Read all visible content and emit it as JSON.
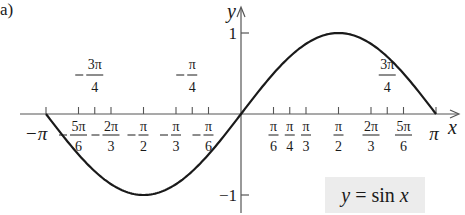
{
  "panel_label": "a)",
  "legend": {
    "y": "y",
    "eq": " = sin ",
    "x": "x"
  },
  "axes": {
    "x_label": "x",
    "y_label": "y"
  },
  "colors": {
    "curve": "#1a1a1a",
    "axis": "#555555",
    "legend_bg": "#ececec"
  },
  "chart_data": {
    "type": "line",
    "title": "",
    "xlabel": "x",
    "ylabel": "y",
    "xlim": [
      -3.14159,
      3.14159
    ],
    "ylim": [
      -1,
      1
    ],
    "grid": false,
    "legend_position": "bottom-right",
    "series": [
      {
        "name": "y = sin x",
        "x": [
          -3.14159,
          -2.61799,
          -2.35619,
          -2.0944,
          -1.5708,
          -1.0472,
          -0.7854,
          -0.5236,
          0,
          0.5236,
          0.7854,
          1.0472,
          1.5708,
          2.0944,
          2.35619,
          2.61799,
          3.14159
        ],
        "y": [
          0,
          -0.5,
          -0.7071,
          -0.866,
          -1,
          -0.866,
          -0.7071,
          -0.5,
          0,
          0.5,
          0.7071,
          0.866,
          1,
          0.866,
          0.7071,
          0.5,
          0
        ]
      }
    ],
    "x_ticks": [
      {
        "value": -3.14159,
        "num": "−π",
        "den": "",
        "position": "below"
      },
      {
        "value": -2.61799,
        "num": "5π",
        "den": "6",
        "sign": "−",
        "position": "below"
      },
      {
        "value": -2.35619,
        "num": "3π",
        "den": "4",
        "sign": "−",
        "position": "above"
      },
      {
        "value": -2.0944,
        "num": "2π",
        "den": "3",
        "sign": "−",
        "position": "below"
      },
      {
        "value": -1.5708,
        "num": "π",
        "den": "2",
        "sign": "−",
        "position": "below"
      },
      {
        "value": -1.0472,
        "num": "π",
        "den": "3",
        "sign": "−",
        "position": "below"
      },
      {
        "value": -0.7854,
        "num": "π",
        "den": "4",
        "sign": "−",
        "position": "above"
      },
      {
        "value": -0.5236,
        "num": "π",
        "den": "6",
        "sign": "−",
        "position": "below"
      },
      {
        "value": 0.5236,
        "num": "π",
        "den": "6",
        "sign": "",
        "position": "below"
      },
      {
        "value": 0.7854,
        "num": "π",
        "den": "4",
        "sign": "",
        "position": "below"
      },
      {
        "value": 1.0472,
        "num": "π",
        "den": "3",
        "sign": "",
        "position": "below"
      },
      {
        "value": 1.5708,
        "num": "π",
        "den": "2",
        "sign": "",
        "position": "below"
      },
      {
        "value": 2.0944,
        "num": "2π",
        "den": "3",
        "sign": "",
        "position": "below"
      },
      {
        "value": 2.35619,
        "num": "3π",
        "den": "4",
        "sign": "",
        "position": "above"
      },
      {
        "value": 2.61799,
        "num": "5π",
        "den": "6",
        "sign": "",
        "position": "below"
      },
      {
        "value": 3.14159,
        "num": "π",
        "den": "",
        "position": "below"
      }
    ],
    "y_ticks": [
      {
        "value": 1,
        "label": "1"
      },
      {
        "value": -1,
        "label": "−1"
      }
    ],
    "annotations": [
      "y = sin x"
    ]
  }
}
